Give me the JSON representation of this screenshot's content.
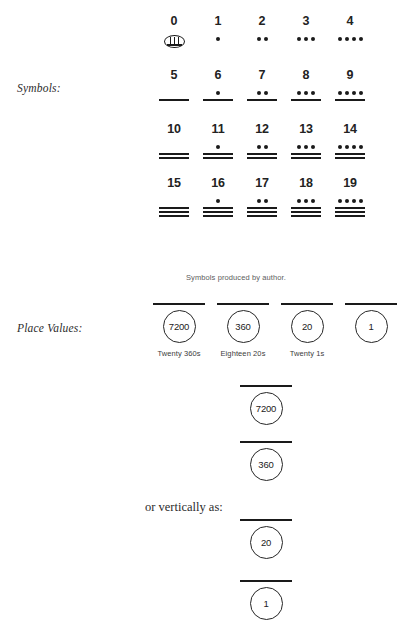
{
  "labels": {
    "symbols": "Symbols:",
    "place_values": "Place Values:",
    "vertically_note": "or vertically as:"
  },
  "caption": "Symbols produced by author.",
  "symbol_table": {
    "rows": [
      {
        "cells": [
          {
            "number": "0",
            "glyph": "shell",
            "dots": 0,
            "bars": 0
          },
          {
            "number": "1",
            "glyph": "dots-bars",
            "dots": 1,
            "bars": 0
          },
          {
            "number": "2",
            "glyph": "dots-bars",
            "dots": 2,
            "bars": 0
          },
          {
            "number": "3",
            "glyph": "dots-bars",
            "dots": 3,
            "bars": 0
          },
          {
            "number": "4",
            "glyph": "dots-bars",
            "dots": 4,
            "bars": 0
          }
        ]
      },
      {
        "cells": [
          {
            "number": "5",
            "glyph": "dots-bars",
            "dots": 0,
            "bars": 1
          },
          {
            "number": "6",
            "glyph": "dots-bars",
            "dots": 1,
            "bars": 1
          },
          {
            "number": "7",
            "glyph": "dots-bars",
            "dots": 2,
            "bars": 1
          },
          {
            "number": "8",
            "glyph": "dots-bars",
            "dots": 3,
            "bars": 1
          },
          {
            "number": "9",
            "glyph": "dots-bars",
            "dots": 4,
            "bars": 1
          }
        ]
      },
      {
        "cells": [
          {
            "number": "10",
            "glyph": "dots-bars",
            "dots": 0,
            "bars": 2
          },
          {
            "number": "11",
            "glyph": "dots-bars",
            "dots": 1,
            "bars": 2
          },
          {
            "number": "12",
            "glyph": "dots-bars",
            "dots": 2,
            "bars": 2
          },
          {
            "number": "13",
            "glyph": "dots-bars",
            "dots": 3,
            "bars": 2
          },
          {
            "number": "14",
            "glyph": "dots-bars",
            "dots": 4,
            "bars": 2
          }
        ]
      },
      {
        "cells": [
          {
            "number": "15",
            "glyph": "dots-bars",
            "dots": 0,
            "bars": 3
          },
          {
            "number": "16",
            "glyph": "dots-bars",
            "dots": 1,
            "bars": 3
          },
          {
            "number": "17",
            "glyph": "dots-bars",
            "dots": 2,
            "bars": 3
          },
          {
            "number": "18",
            "glyph": "dots-bars",
            "dots": 3,
            "bars": 3
          },
          {
            "number": "19",
            "glyph": "dots-bars",
            "dots": 4,
            "bars": 3
          }
        ]
      }
    ]
  },
  "place_values": {
    "cells": [
      {
        "value": "7200",
        "sublabel": "Twenty  360s"
      },
      {
        "value": "360",
        "sublabel": "Eighteen 20s"
      },
      {
        "value": "20",
        "sublabel": "Twenty 1s"
      },
      {
        "value": "1",
        "sublabel": ""
      }
    ]
  },
  "vertical_stack": {
    "items": [
      {
        "value": "7200",
        "top": 385
      },
      {
        "value": "360",
        "top": 441
      },
      {
        "value": "20",
        "top": 519
      },
      {
        "value": "1",
        "top": 580
      }
    ]
  },
  "colors": {
    "ink": "#1a1a1a",
    "muted": "#5d5d5d",
    "background": "#ffffff"
  }
}
